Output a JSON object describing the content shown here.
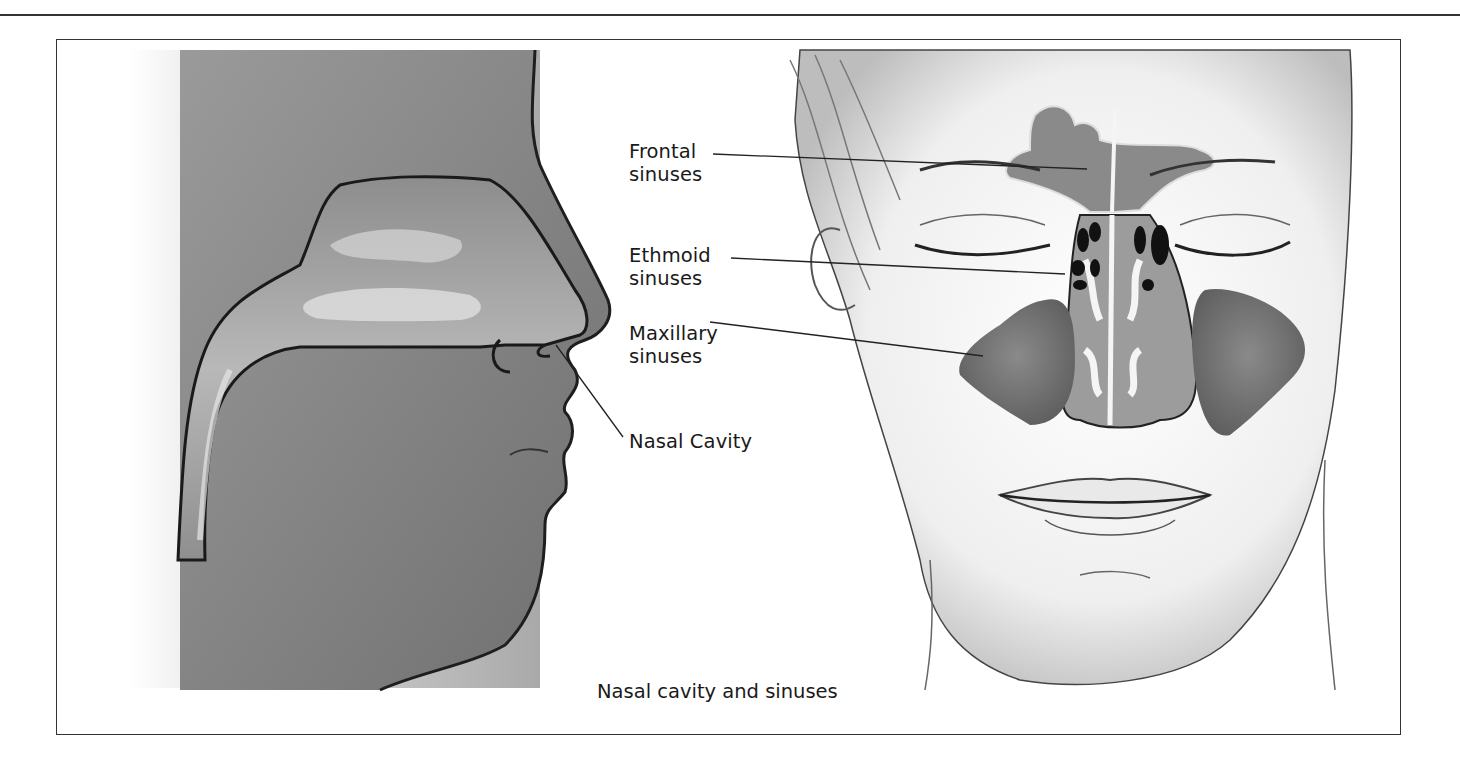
{
  "figure": {
    "caption": "Nasal cavity and sinuses",
    "panels": [
      {
        "name": "side-profile",
        "description": "Sagittal view of head showing nasal cavity"
      },
      {
        "name": "frontal-face",
        "description": "Frontal view of face showing paranasal sinuses"
      }
    ],
    "labels": {
      "frontal": "Frontal\nsinuses",
      "ethmoid": "Ethmoid\nsinuses",
      "maxillary": "Maxillary\nsinuses",
      "nasal_cavity": "Nasal Cavity"
    },
    "colors": {
      "skin_shade": "#8a8a8a",
      "cavity": "#a8a8a8",
      "sinus_dark": "#6a6a6a",
      "ethmoid": "#111111",
      "outline": "#222222"
    }
  }
}
